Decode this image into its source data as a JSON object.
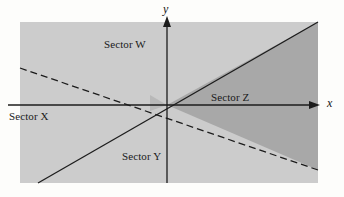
{
  "figure": {
    "background_color": "#fdfdfb",
    "width": 344,
    "height": 197
  },
  "axes": {
    "x_label": "x",
    "y_label": "y",
    "origin": {
      "x": 167,
      "y": 105
    },
    "x_axis": {
      "start_x": 8,
      "end_x": 318,
      "y": 105,
      "arrow": "right",
      "color": "#1c1c1c"
    },
    "y_axis": {
      "x": 167,
      "start_y": 183,
      "end_y": 17,
      "arrow": "up",
      "color": "#1c1c1c"
    }
  },
  "regions": {
    "light_shade_color": "#cccccc",
    "dark_shade_color": "#a8a8a8",
    "outline_color": "#1c1c1c",
    "plot_rect": {
      "left": 20,
      "top": 22,
      "right": 318,
      "bottom": 183
    }
  },
  "lines": [
    {
      "name": "solid-boundary",
      "style": "solid",
      "color": "#1c1c1c",
      "from": {
        "x": 38,
        "y": 183
      },
      "to": {
        "x": 318,
        "y": 22
      },
      "through_origin": true
    },
    {
      "name": "dashed-boundary",
      "style": "dashed",
      "color": "#1c1c1c",
      "from": {
        "x": 20,
        "y": 68
      },
      "to": {
        "x": 318,
        "y": 170
      },
      "through_origin": true
    }
  ],
  "sectors": [
    {
      "id": "w",
      "label": "Sector W",
      "shade": "light",
      "position": {
        "left": 104,
        "top": 38
      }
    },
    {
      "id": "x",
      "label": "Sector X",
      "shade": "unshaded",
      "position": {
        "left": 9,
        "top": 110
      }
    },
    {
      "id": "y",
      "label": "Sector Y",
      "shade": "light",
      "position": {
        "left": 122,
        "top": 150
      }
    },
    {
      "id": "z",
      "label": "Sector Z",
      "shade": "dark",
      "position": {
        "left": 211,
        "top": 91
      }
    }
  ]
}
